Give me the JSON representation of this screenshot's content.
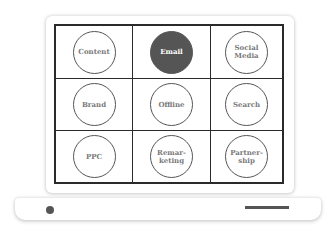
{
  "illustration": {
    "device": "laptop",
    "accent_color": "#555555",
    "grid": {
      "rows": 3,
      "columns": 3,
      "cells": [
        {
          "label": "Content",
          "active": false
        },
        {
          "label": "Email",
          "active": true
        },
        {
          "label": "Social\nMedia",
          "active": false
        },
        {
          "label": "Brand",
          "active": false
        },
        {
          "label": "Offline",
          "active": false
        },
        {
          "label": "Search",
          "active": false
        },
        {
          "label": "PPC",
          "active": false
        },
        {
          "label": "Remar-\nketing",
          "active": false
        },
        {
          "label": "Partner-\nship",
          "active": false
        }
      ]
    }
  }
}
